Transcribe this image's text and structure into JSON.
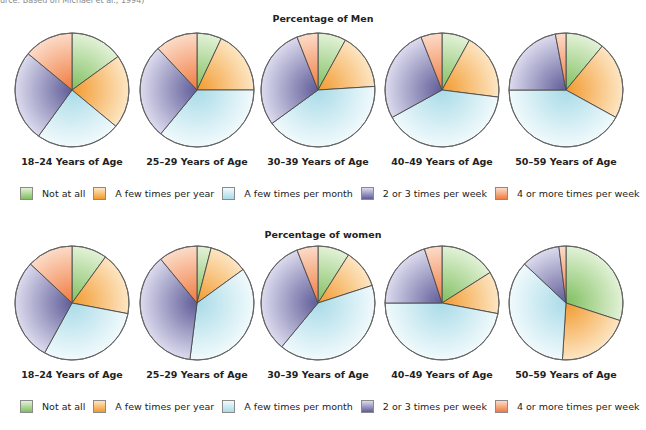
{
  "source_note": "urce: Based on Michael et al., 1994)",
  "legend": [
    {
      "label": "Not at all",
      "color": "#a9d48e"
    },
    {
      "label": "A few times per year",
      "color": "#f5b867"
    },
    {
      "label": "A few times per month",
      "color": "#d4eef4"
    },
    {
      "label": "2 or 3 times per week",
      "color": "#8e8cba"
    },
    {
      "label": "4 or more times per week",
      "color": "#f39a6c"
    }
  ],
  "chart_data": [
    {
      "type": "pie",
      "title": "Percentage of Men",
      "categories": [
        "Not at all",
        "A few times per year",
        "A few times per month",
        "2 or 3 times per week",
        "4 or more times per week"
      ],
      "series": [
        {
          "name": "18–24 Years of Age",
          "values": [
            15,
            21,
            24,
            26,
            14
          ]
        },
        {
          "name": "25–29 Years of Age",
          "values": [
            7,
            18,
            36,
            27,
            12
          ]
        },
        {
          "name": "30–39 Years of Age",
          "values": [
            8,
            16,
            41,
            29,
            6
          ]
        },
        {
          "name": "40–49 Years of Age",
          "values": [
            8,
            19,
            40,
            27,
            6
          ]
        },
        {
          "name": "50–59 Years of Age",
          "values": [
            11,
            22,
            42,
            22,
            3
          ]
        }
      ],
      "start_angle": "12 o'clock",
      "direction": "clockwise"
    },
    {
      "type": "pie",
      "title": "Percentage of women",
      "categories": [
        "Not at all",
        "A few times per year",
        "A few times per month",
        "2 or 3 times per week",
        "4 or more times per week"
      ],
      "series": [
        {
          "name": "18–24 Years of Age",
          "values": [
            10,
            18,
            30,
            29,
            13
          ]
        },
        {
          "name": "25–29 Years of Age",
          "values": [
            4,
            11,
            37,
            37,
            11
          ]
        },
        {
          "name": "30–39 Years of Age",
          "values": [
            9,
            11,
            41,
            33,
            6
          ]
        },
        {
          "name": "40–49 Years of Age",
          "values": [
            16,
            12,
            47,
            20,
            5
          ]
        },
        {
          "name": "50–59 Years of Age",
          "values": [
            30,
            21,
            36,
            11,
            2
          ]
        }
      ],
      "start_angle": "12 o'clock",
      "direction": "clockwise"
    }
  ],
  "men": {
    "title": "Percentage of Men"
  },
  "women": {
    "title": "Percentage of women"
  }
}
